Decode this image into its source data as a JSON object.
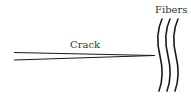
{
  "diagram": {
    "labels": {
      "crack": "Crack",
      "fibers": "Fibers"
    },
    "colors": {
      "stroke": "#1a1a1a",
      "text": "#333333",
      "background": "#ffffff"
    },
    "elements": {
      "crack": {
        "type": "wedge",
        "description": "two converging lines forming a crack tip"
      },
      "fibers": {
        "type": "wavy-lines",
        "count": 3
      }
    }
  }
}
